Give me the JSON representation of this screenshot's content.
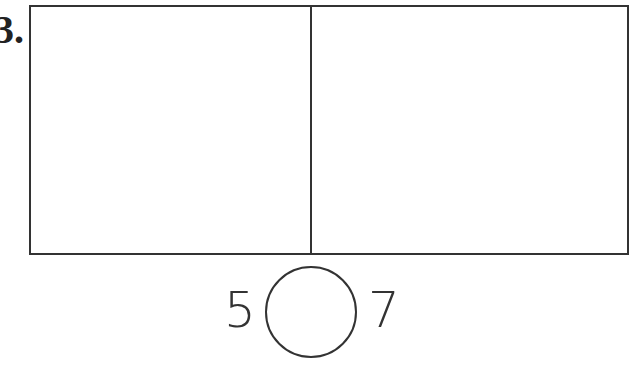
{
  "problem": {
    "label": "3.",
    "left_number": "5",
    "right_number": "7",
    "comparison_answer": ""
  }
}
